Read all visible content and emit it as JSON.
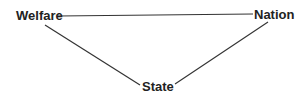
{
  "diagram": {
    "type": "triangle-relationship",
    "nodes": [
      {
        "id": "welfare",
        "label": "Welfare"
      },
      {
        "id": "nation",
        "label": "Nation"
      },
      {
        "id": "state",
        "label": "State"
      }
    ],
    "edges": [
      {
        "from": "welfare",
        "to": "nation"
      },
      {
        "from": "welfare",
        "to": "state"
      },
      {
        "from": "state",
        "to": "nation"
      }
    ],
    "colors": {
      "line": "#333333",
      "text": "#222222",
      "background": "#ffffff"
    }
  }
}
